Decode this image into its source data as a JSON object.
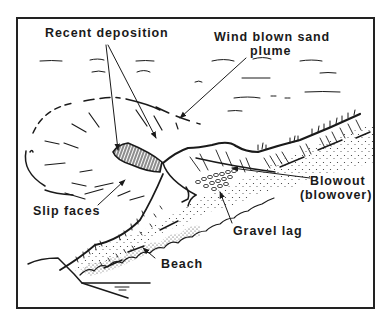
{
  "figure": {
    "type": "schematic block diagram",
    "colors": {
      "ink": "#1a1a1a",
      "background": "#ffffff",
      "frame": "#222222"
    },
    "labels": {
      "recent_deposition": "Recent deposition",
      "wind_blown_line1": "Wind blown sand",
      "wind_blown_line2": "plume",
      "slip_faces": "Slip faces",
      "blowout_line1": "Blowout",
      "blowout_line2": "(blowover)",
      "gravel_lag": "Gravel lag",
      "beach": "Beach"
    }
  }
}
